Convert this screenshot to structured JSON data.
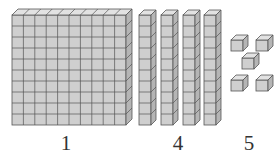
{
  "colors": {
    "face": "#cfcfcf",
    "side": "#b5b5b5",
    "top": "#e2e2e2",
    "stroke": "#555555"
  },
  "groups": [
    {
      "name": "hundreds-flat",
      "count_label": "1",
      "blocks": 1,
      "type": "flat"
    },
    {
      "name": "tens-rods",
      "count_label": "4",
      "blocks": 4,
      "type": "rod"
    },
    {
      "name": "ones-cubes",
      "count_label": "5",
      "blocks": 5,
      "type": "unit"
    }
  ]
}
